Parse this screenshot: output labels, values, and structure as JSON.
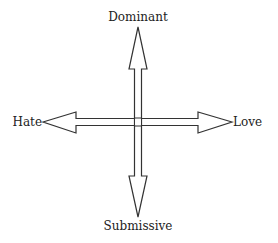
{
  "diagram": {
    "type": "two-axis-cross",
    "labels": {
      "top": "Dominant",
      "bottom": "Submissive",
      "left": "Hate",
      "right": "Love"
    },
    "axes": [
      {
        "name": "vertical",
        "positive": "Dominant",
        "negative": "Submissive"
      },
      {
        "name": "horizontal",
        "positive": "Love",
        "negative": "Hate"
      }
    ],
    "stroke_color": "#333333",
    "fill_color": "#ffffff"
  }
}
